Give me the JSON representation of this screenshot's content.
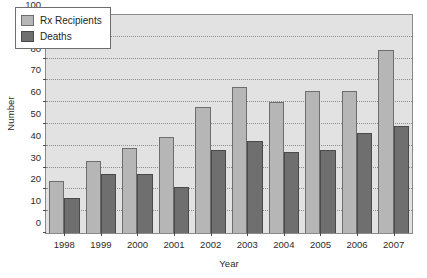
{
  "chart_data": {
    "type": "bar",
    "title": "",
    "xlabel": "Year",
    "ylabel": "Number",
    "categories": [
      "1998",
      "1999",
      "2000",
      "2001",
      "2002",
      "2003",
      "2004",
      "2005",
      "2006",
      "2007"
    ],
    "series": [
      {
        "name": "Rx Recipients",
        "color": "#b6b6b6",
        "values": [
          24,
          33,
          39,
          44,
          58,
          67,
          60,
          65,
          65,
          84
        ]
      },
      {
        "name": "Deaths",
        "color": "#6f6f6f",
        "values": [
          16,
          27,
          27,
          21,
          38,
          42,
          37,
          38,
          46,
          49
        ]
      }
    ],
    "ylim": [
      0,
      100
    ],
    "ytick_labels": [
      "0",
      "10",
      "20",
      "30",
      "40",
      "50",
      "60",
      "70",
      "80",
      "90",
      "100"
    ],
    "ytick_values": [
      0,
      10,
      20,
      30,
      40,
      50,
      60,
      70,
      80,
      90,
      100
    ],
    "grid": true,
    "grid_axis": "y",
    "grid_style": "dotted",
    "legend_position": "upper-left",
    "plot_background": "#e2e2e2",
    "figure_background": "#ffffff",
    "frame_color": "#8a8a8a"
  }
}
